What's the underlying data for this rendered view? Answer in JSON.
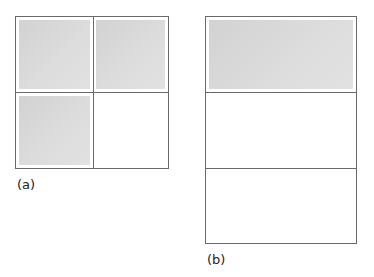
{
  "figure": {
    "type": "grid-layout-comparison",
    "line_color": "#6a6a6a",
    "fill_color": "#d9d9d9",
    "background": "#ffffff"
  },
  "diagrams": [
    {
      "id": "a",
      "label": "(a)",
      "layout": "2x2 grid",
      "rows": 2,
      "cols": 2,
      "cells": [
        {
          "row": 0,
          "col": 0,
          "filled": true
        },
        {
          "row": 0,
          "col": 1,
          "filled": true
        },
        {
          "row": 1,
          "col": 0,
          "filled": true
        },
        {
          "row": 1,
          "col": 1,
          "filled": false
        }
      ],
      "filled_count": 3,
      "total_cells": 4
    },
    {
      "id": "b",
      "label": "(b)",
      "layout": "3x1 stacked rows",
      "rows": 3,
      "cols": 1,
      "cells": [
        {
          "row": 0,
          "col": 0,
          "filled": true
        },
        {
          "row": 1,
          "col": 0,
          "filled": false
        },
        {
          "row": 2,
          "col": 0,
          "filled": false
        }
      ],
      "filled_count": 1,
      "total_cells": 3
    }
  ]
}
